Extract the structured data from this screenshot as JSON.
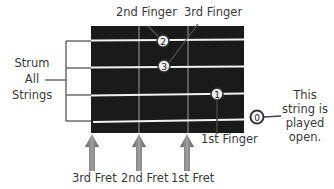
{
  "labels": {
    "finger2": "2nd Finger",
    "finger3": "3rd Finger",
    "finger1": "1st Finger",
    "strum_line1": "Strum",
    "strum_line2": "All",
    "strum_line3": "Strings",
    "open_line1": "This",
    "open_line2": "string is",
    "open_line3": "played",
    "open_line4": "open.",
    "fret3": "3rd Fret",
    "fret2": "2nd Fret",
    "fret1": "1st Fret"
  },
  "markers": {
    "m2": "2",
    "m3": "3",
    "m1": "1",
    "m0": "0"
  },
  "colors": {
    "board": "#1a1a1a",
    "string": "#f2f2f2",
    "fret": "#8a8a8a",
    "arrow": "#7a7a7a",
    "text": "#3a3a3a"
  }
}
